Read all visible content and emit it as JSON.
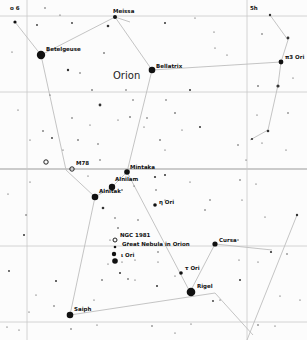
{
  "map": {
    "constellation_name": "Orion",
    "corner_labels": {
      "top_left": "o 6",
      "top_right": "5h"
    },
    "labels": {
      "meissa": "Meissa",
      "betelgeuse": "Betelgeuse",
      "bellatrix": "Bellatrix",
      "pi3_ori": "π3 Ori",
      "m78": "M78",
      "mintaka": "Mintaka",
      "alnilam": "Alnilam",
      "alnitak": "Alnitak",
      "eta_ori": "η Ori",
      "ngc1981": "NGC 1981",
      "orion_nebula": "Great Nebula in Orion",
      "iota_ori": "ι Ori",
      "cursa": "Cursa",
      "tau_ori": "τ Ori",
      "rigel": "Rigel",
      "saiph": "Saiph"
    },
    "colors": {
      "background": "#fcfcfc",
      "star": "#111111",
      "grid": "#c9c9c9",
      "constellation_lines": "#bdbdbd"
    }
  }
}
